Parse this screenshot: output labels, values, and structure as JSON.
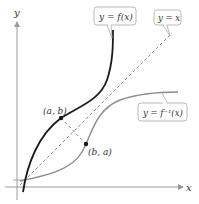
{
  "diagram": {
    "axes": {
      "x_label": "x",
      "y_label": "y"
    },
    "curves": {
      "f": {
        "label": "y = f(x)",
        "color": "#1a1a1a"
      },
      "f_inverse": {
        "label": "y = f⁻¹(x)",
        "color": "#8c8c8c"
      },
      "identity": {
        "label": "y = x",
        "color": "#8c8c8c",
        "style": "dashed"
      }
    },
    "points": [
      {
        "label": "(a, b)",
        "on": "f"
      },
      {
        "label": "(b, a)",
        "on": "f_inverse"
      }
    ],
    "colors": {
      "axis": "#9a9a9a",
      "callout_border": "#a8a8a8",
      "text": "#333333"
    }
  }
}
